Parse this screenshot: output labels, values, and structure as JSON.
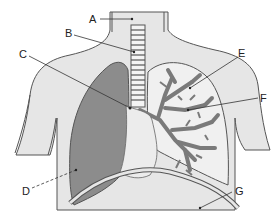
{
  "diagram": {
    "type": "anatomical-respiratory-system",
    "labels": [
      {
        "id": "A",
        "text": "A",
        "x": 87,
        "y": 21
      },
      {
        "id": "B",
        "text": "B",
        "x": 67,
        "y": 38
      },
      {
        "id": "C",
        "text": "C",
        "x": 21,
        "y": 55
      },
      {
        "id": "D",
        "text": "D",
        "x": 23,
        "y": 191
      },
      {
        "id": "E",
        "text": "E",
        "x": 241,
        "y": 55
      },
      {
        "id": "F",
        "text": "F",
        "x": 261,
        "y": 100
      },
      {
        "id": "G",
        "text": "G",
        "x": 236,
        "y": 192
      }
    ],
    "colors": {
      "body_fill": "#e6e6e6",
      "outline": "#555555",
      "collapsed_lung": "#8c8c8c",
      "bronchial_tree": "#7a7a7a",
      "pleura_fill": "#f0f0f0",
      "leader_line": "#333333",
      "background": "#ffffff"
    }
  }
}
